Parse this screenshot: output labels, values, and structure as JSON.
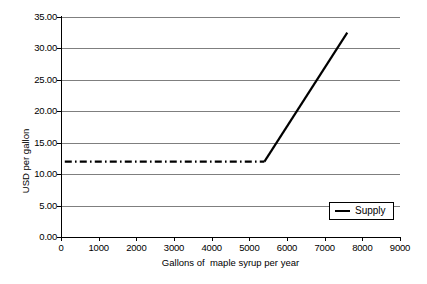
{
  "chart_data": {
    "type": "line",
    "title": "",
    "xlabel": "Gallons of  maple syrup per year",
    "ylabel": "USD per gallon",
    "xlim": [
      0,
      9000
    ],
    "ylim": [
      0.0,
      35.0
    ],
    "xticks": [
      "0",
      "1000",
      "2000",
      "3000",
      "4000",
      "5000",
      "6000",
      "7000",
      "8000",
      "9000"
    ],
    "xtick_values": [
      0,
      1000,
      2000,
      3000,
      4000,
      5000,
      6000,
      7000,
      8000,
      9000
    ],
    "yticks": [
      "0.00",
      "5.00",
      "10.00",
      "15.00",
      "20.00",
      "25.00",
      "30.00",
      "35.00"
    ],
    "ytick_values": [
      0.0,
      5.0,
      10.0,
      15.0,
      20.0,
      25.0,
      30.0,
      35.0
    ],
    "grid": true,
    "grid_axis": "y",
    "legend_position": "bottom-right",
    "series": [
      {
        "name": "Supply",
        "color": "#000000",
        "segments": [
          {
            "name": "flat-reservation-price-segment",
            "style": "dash-dot",
            "x": [
              100,
              5400
            ],
            "y": [
              12.0,
              12.0
            ]
          },
          {
            "name": "rising-supply-segment",
            "style": "solid",
            "x": [
              5400,
              7600
            ],
            "y": [
              12.0,
              32.5
            ]
          }
        ]
      }
    ]
  },
  "legend": {
    "entries": [
      {
        "label": "Supply",
        "marker": "line-marker"
      }
    ]
  }
}
